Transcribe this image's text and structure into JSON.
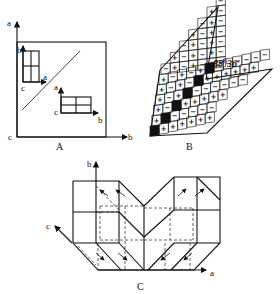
{
  "panels": {
    "A": {
      "caption": "A",
      "outer_axes": {
        "vertical": "a",
        "horizontal": "b",
        "origin": "c"
      },
      "upper_cell": {
        "up_axis": "b",
        "right_axis": "a",
        "origin": "c"
      },
      "lower_cell": {
        "up_axis": "a",
        "right_axis": "b",
        "origin": "c"
      },
      "divider": "diagonal twin boundary"
    },
    "B": {
      "caption": "B",
      "angle_label": "88°36′",
      "left_arm_rows": [
        [
          "-"
        ],
        [
          "+",
          "-"
        ],
        [
          "-",
          "+",
          "-"
        ],
        [
          "+",
          "-",
          "+",
          "-"
        ],
        [
          "-",
          "+",
          "-",
          "+",
          "-"
        ],
        [
          "+",
          "-",
          "+",
          "-",
          "+",
          "-"
        ],
        [
          "-",
          "+",
          "-",
          "+",
          "-",
          "+",
          "-"
        ]
      ],
      "main_rows": [
        [
          "+",
          "-",
          "+",
          "-",
          "+",
          "black",
          "-",
          "-",
          "-",
          "-",
          "-",
          "-"
        ],
        [
          "+",
          "-",
          "+",
          "-",
          "black",
          "+",
          "+",
          "+",
          "+",
          "+",
          "+"
        ],
        [
          "+",
          "-",
          "+",
          "black",
          "-",
          "-",
          "-",
          "-",
          "-",
          "-"
        ],
        [
          "+",
          "-",
          "black",
          "+",
          "+",
          "+",
          "+",
          "+"
        ],
        [
          "+",
          "black",
          "-",
          "-",
          "-",
          "-",
          "-"
        ],
        [
          "black",
          "+",
          "+",
          "+",
          "+",
          "+",
          "+"
        ]
      ],
      "symbols": {
        "plus": "+",
        "minus": "−"
      }
    },
    "C": {
      "caption": "C",
      "axes": {
        "b": "b",
        "c": "c",
        "a": "a"
      }
    }
  }
}
